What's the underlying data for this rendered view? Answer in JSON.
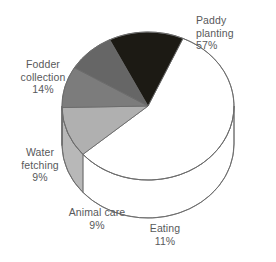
{
  "chart_data": {
    "type": "pie",
    "title": "",
    "subtitle": "",
    "xlabel": "",
    "ylabel": "",
    "legend_position": "none",
    "grid": false,
    "three_d": true,
    "start_angle_deg": -66,
    "direction": "clockwise",
    "categories": [
      "Paddy planting",
      "Eating",
      "Animal care",
      "Water fetching",
      "Fodder collection"
    ],
    "values": [
      57,
      11,
      9,
      9,
      14
    ],
    "unit": "%",
    "slices": [
      {
        "label": "Paddy planting",
        "value": 57,
        "value_text": "57%",
        "top_color": "#ffffff",
        "side_color": "#ffffff",
        "label_align": "left"
      },
      {
        "label": "Eating",
        "value": 11,
        "value_text": "11%",
        "top_color": "#b0b0b0",
        "side_color": "#b8b8b8",
        "label_align": "center"
      },
      {
        "label": "Animal care",
        "value": 9,
        "value_text": "9%",
        "top_color": "#7c7c7c",
        "side_color": "#6e6e6e",
        "label_align": "center"
      },
      {
        "label": "Water fetching",
        "value": 9,
        "value_text": "9%",
        "top_color": "#666666",
        "side_color": "#5a5a5a",
        "label_align": "center"
      },
      {
        "label": "Fodder collection",
        "value": 14,
        "value_text": "14%",
        "top_color": "#1c1a14",
        "side_color": "#16140f",
        "label_align": "center"
      }
    ],
    "colors": {
      "background": "#ffffff",
      "outline": "#6b6b6b",
      "text": "#58595b"
    }
  },
  "labels": {
    "paddy": {
      "name": "Paddy planting",
      "line1": "Paddy",
      "line2": "planting",
      "pct": "57%"
    },
    "fodder": {
      "name": "Fodder collection",
      "line1": "Fodder",
      "line2": "collection",
      "pct": "14%"
    },
    "water": {
      "name": "Water fetching",
      "line1": "Water",
      "line2": "fetching",
      "pct": "9%"
    },
    "animal": {
      "name": "Animal care",
      "line1": "Animal care",
      "line2": "",
      "pct": "9%"
    },
    "eating": {
      "name": "Eating",
      "line1": "Eating",
      "line2": "",
      "pct": "11%"
    }
  }
}
